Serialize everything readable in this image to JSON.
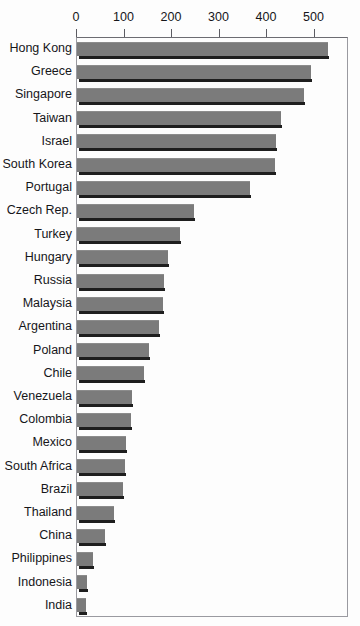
{
  "figure": {
    "title_fragment": "",
    "background_color": "#fdfdfd",
    "bar_color": "#7b7b7b",
    "bar_shadow_color": "#1e1e1e",
    "frame_color": "#9a9aa0",
    "text_color": "#16161a"
  },
  "chart_data": {
    "type": "bar",
    "orientation": "horizontal",
    "title": "",
    "xlabel": "",
    "ylabel": "",
    "xlim": [
      0,
      560
    ],
    "xticks": [
      0,
      100,
      200,
      300,
      400,
      500
    ],
    "xtick_labels": [
      "0",
      "100",
      "200",
      "300",
      "400",
      "500"
    ],
    "grid": false,
    "legend": "none",
    "categories": [
      "Hong Kong",
      "Greece",
      "Singapore",
      "Taiwan",
      "Israel",
      "South Korea",
      "Portugal",
      "Czech Rep.",
      "Turkey",
      "Hungary",
      "Russia",
      "Malaysia",
      "Argentina",
      "Poland",
      "Chile",
      "Venezuela",
      "Colombia",
      "Mexico",
      "South Africa",
      "Brazil",
      "Thailand",
      "China",
      "Philippines",
      "Indonesia",
      "India"
    ],
    "values": [
      528,
      493,
      478,
      430,
      419,
      417,
      364,
      246,
      217,
      192,
      183,
      181,
      173,
      152,
      141,
      116,
      114,
      103,
      101,
      97,
      78,
      59,
      34,
      21,
      19
    ]
  }
}
